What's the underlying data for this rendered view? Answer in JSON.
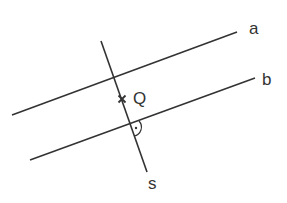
{
  "diagram": {
    "line_color": "#333333",
    "lines": {
      "a": {
        "label": "a",
        "x1": 12,
        "y1": 115,
        "x2": 237,
        "y2": 32
      },
      "b": {
        "label": "b",
        "x1": 30,
        "y1": 160,
        "x2": 255,
        "y2": 78
      },
      "s": {
        "label": "s",
        "x1": 101,
        "y1": 41,
        "x2": 147,
        "y2": 172
      }
    },
    "point": {
      "label": "Q",
      "x": 122,
      "y": 99
    },
    "right_angle": {
      "x": 130,
      "y": 124
    }
  }
}
